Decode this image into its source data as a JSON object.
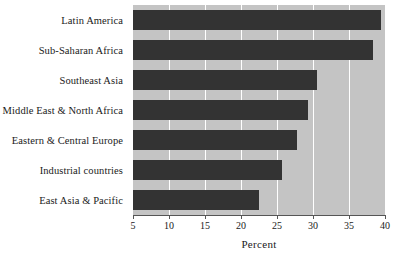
{
  "chart_data": {
    "type": "bar",
    "orientation": "horizontal",
    "title": "",
    "xlabel": "Percent",
    "ylabel": "",
    "xlim": [
      5,
      40
    ],
    "xticks": [
      5,
      10,
      15,
      20,
      25,
      30,
      35,
      40
    ],
    "xtick_labels": [
      "5",
      "10",
      "15",
      "20",
      "25",
      "30",
      "35",
      "40"
    ],
    "grid": true,
    "legend": "none",
    "categories": [
      "Latin America",
      "Sub-Saharan Africa",
      "Southeast Asia",
      "Middle East & North Africa",
      "Eastern & Central Europe",
      "Industrial countries",
      "East Asia & Pacific"
    ],
    "values": [
      39.4,
      38.3,
      30.5,
      29.3,
      27.8,
      25.7,
      22.5
    ],
    "colors": {
      "bar": "#333333",
      "plot_background": "#c4c4c4",
      "gridline": "#ffffff",
      "axis": "#555555",
      "text": "#1a1a1a",
      "page_background": "#ffffff"
    }
  }
}
